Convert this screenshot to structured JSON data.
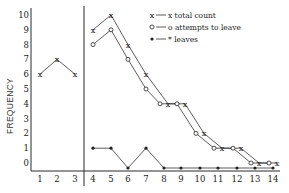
{
  "chart_data": {
    "type": "line",
    "title": "",
    "xlabel": "",
    "ylabel": "FREQUENCY",
    "ylim": [
      0,
      10
    ],
    "xlim": [
      1,
      14
    ],
    "x_ticks": [
      "1",
      "2",
      "3",
      "4",
      "5",
      "6",
      "7",
      "8",
      "9",
      "10",
      "11",
      "12",
      "13",
      "14"
    ],
    "y_ticks": [
      "0",
      "1",
      "2",
      "3",
      "4",
      "5",
      "6",
      "7",
      "8",
      "9",
      "10"
    ],
    "grid": false,
    "legend_position": "top-right",
    "divider_between_x": [
      3,
      4
    ],
    "series": [
      {
        "name": "total count",
        "marker": "x",
        "segments": [
          {
            "x": [
              1,
              2,
              3
            ],
            "y": [
              6,
              7,
              6
            ]
          },
          {
            "x": [
              4,
              5,
              6,
              7,
              8,
              9,
              10,
              11,
              12,
              13,
              14
            ],
            "y": [
              9,
              10,
              8,
              6,
              4,
              4,
              2,
              1,
              1,
              0,
              0
            ]
          }
        ]
      },
      {
        "name": "attempts to leave",
        "marker": "o",
        "segments": [
          {
            "x": [
              4,
              5,
              6,
              7,
              8,
              9,
              10,
              11,
              12,
              13,
              14
            ],
            "y": [
              8,
              9,
              7,
              5,
              4,
              4,
              2,
              1,
              1,
              0,
              0
            ]
          }
        ]
      },
      {
        "name": "leaves",
        "marker": "*",
        "segments": [
          {
            "x": [
              4,
              5,
              6,
              7,
              8,
              9,
              10,
              11,
              12,
              13,
              14
            ],
            "y": [
              1,
              1,
              0,
              1,
              0,
              0,
              0,
              0,
              0,
              0,
              0
            ]
          }
        ]
      }
    ],
    "legend": [
      {
        "marker": "x",
        "label": "x total count"
      },
      {
        "marker": "o",
        "label": "o attempts to leave"
      },
      {
        "marker": "*",
        "label": "* leaves"
      }
    ],
    "annotations": [
      "ox"
    ]
  }
}
